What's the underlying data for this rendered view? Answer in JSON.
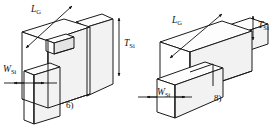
{
  "figure": {
    "type": "technical-line-drawing",
    "background_color": "#ffffff",
    "line_color": "#1a1a1a",
    "panel_count": 2
  },
  "panels": [
    {
      "id": "panel-6",
      "number_label": "6)",
      "description": "Double-gate / tri-gate fin structure: tall vertical silicon body with a gate slab wrapping the fin, small rectangular notch opening at the gate front face",
      "dimensions": [
        {
          "name": "gate-length",
          "symbol": "L",
          "subscript": "G",
          "annotation_style": "double-headed-arrow-leader",
          "orientation": "oblique"
        },
        {
          "name": "silicon-thickness",
          "symbol": "T",
          "subscript": "Si",
          "annotation_style": "vertical-double-arrow",
          "orientation": "vertical"
        },
        {
          "name": "silicon-width",
          "symbol": "W",
          "subscript": "Si",
          "annotation_style": "horizontal-double-arrow",
          "orientation": "horizontal"
        }
      ]
    },
    {
      "id": "panel-8",
      "number_label": "8)",
      "description": "Gate-all-around style fin structure: horizontal silicon bar passing through a rectangular gate block, fin cross-section exposed at front left",
      "dimensions": [
        {
          "name": "gate-length",
          "symbol": "L",
          "subscript": "G",
          "annotation_style": "double-headed-arrow-leader",
          "orientation": "oblique"
        },
        {
          "name": "silicon-thickness",
          "symbol": "T",
          "subscript": "Si",
          "annotation_style": "vertical-double-arrow",
          "orientation": "vertical"
        },
        {
          "name": "silicon-width",
          "symbol": "W",
          "subscript": "Si",
          "annotation_style": "horizontal-double-arrow",
          "orientation": "horizontal"
        }
      ]
    }
  ],
  "labels": {
    "gate_length_symbol": "L",
    "gate_length_subscript": "G",
    "thickness_symbol": "T",
    "thickness_subscript": "Si",
    "width_symbol": "W",
    "width_subscript": "Si",
    "panel6_number": "6)",
    "panel8_number": "8)"
  },
  "colors": {
    "stroke": "#1a1a1a",
    "top_face": "#fdfdfd",
    "front_face": "#ffffff",
    "side_face": "#f2f2f2",
    "inner_face": "#e4e4e4",
    "text": "#111111",
    "background": "#ffffff"
  }
}
